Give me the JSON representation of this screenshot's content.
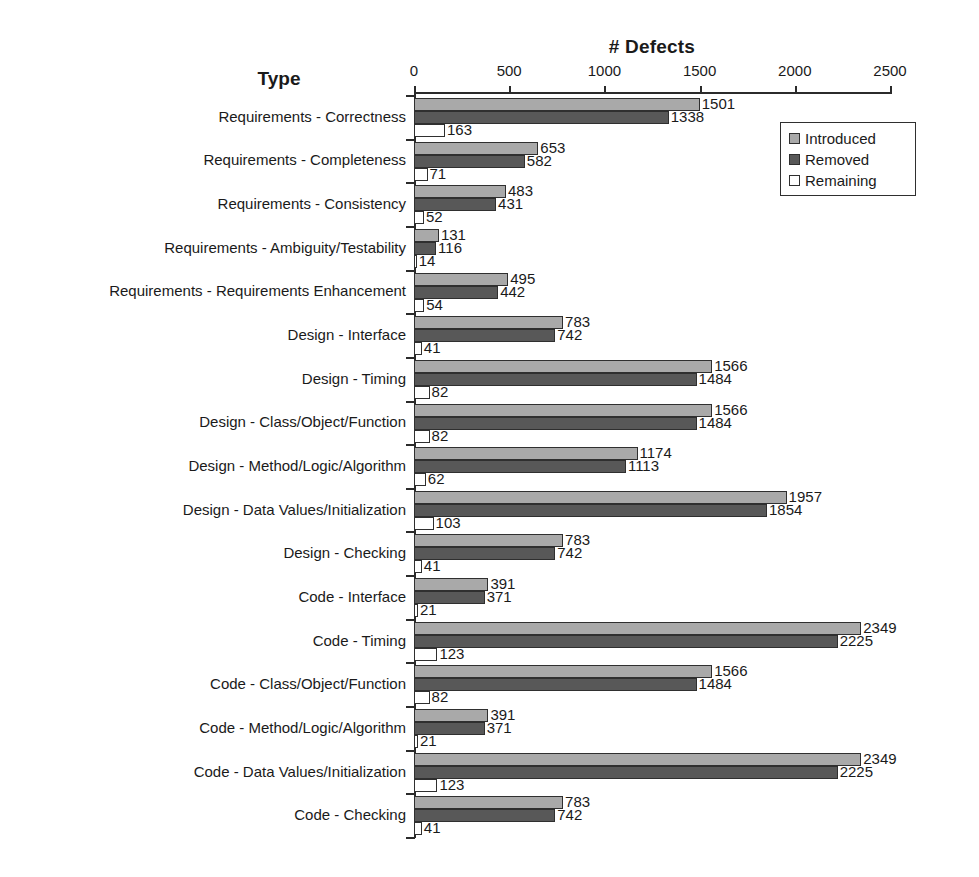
{
  "chart_data": {
    "type": "bar",
    "orientation": "horizontal",
    "title": "# Defects",
    "xlabel": "# Defects",
    "ylabel": "Type",
    "xlim": [
      0,
      2500
    ],
    "xticks": [
      0,
      500,
      1000,
      1500,
      2000,
      2500
    ],
    "xtick_labels": [
      "0",
      "500",
      "1000",
      "1500",
      "2000",
      "2500"
    ],
    "grid": false,
    "legend_position": "top-right",
    "legend": [
      "Introduced",
      "Removed",
      "Remaining"
    ],
    "series": [
      {
        "name": "Introduced",
        "color": "#a9a9a9",
        "values": [
          1501,
          653,
          483,
          131,
          495,
          783,
          1566,
          1566,
          1174,
          1957,
          783,
          391,
          2349,
          1566,
          391,
          2349,
          783
        ]
      },
      {
        "name": "Removed",
        "color": "#585858",
        "values": [
          1338,
          582,
          431,
          116,
          442,
          742,
          1484,
          1484,
          1113,
          1854,
          742,
          371,
          2225,
          1484,
          371,
          2225,
          742
        ]
      },
      {
        "name": "Remaining",
        "color": "#ffffff",
        "values": [
          163,
          71,
          52,
          14,
          54,
          41,
          82,
          82,
          62,
          103,
          41,
          21,
          123,
          82,
          21,
          123,
          41
        ]
      }
    ],
    "categories": [
      "Requirements - Correctness",
      "Requirements - Completeness",
      "Requirements - Consistency",
      "Requirements - Ambiguity/Testability",
      "Requirements - Requirements Enhancement",
      "Design - Interface",
      "Design - Timing",
      "Design - Class/Object/Function",
      "Design - Method/Logic/Algorithm",
      "Design - Data Values/Initialization",
      "Design - Checking",
      "Code - Interface",
      "Code - Timing",
      "Code - Class/Object/Function",
      "Code - Method/Logic/Algorithm",
      "Code - Data Values/Initialization",
      "Code - Checking"
    ]
  },
  "axis_title": "# Defects",
  "type_header": "Type"
}
